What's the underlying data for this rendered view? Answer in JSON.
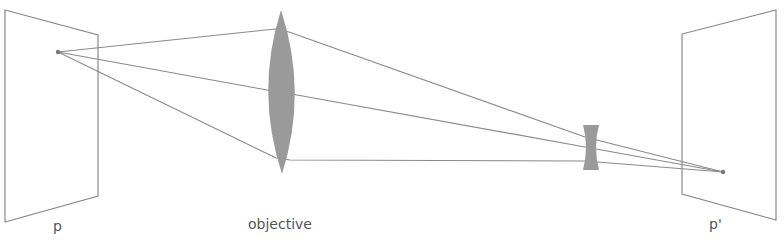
{
  "diagram": {
    "colors": {
      "plane": "#8a8a8a",
      "ray": "#8a8a8a",
      "lens": "#9a9a9a",
      "label": "#555555",
      "background": "#ffffff"
    },
    "labels": {
      "object_plane": "p",
      "objective": "objective",
      "image_plane": "p'"
    },
    "object_plane": {
      "points": "5,10 98,35 98,196 5,222"
    },
    "image_plane": {
      "points": "682,34 776,10 776,220 682,194"
    },
    "object_point": {
      "x": 58,
      "y": 52
    },
    "image_point": {
      "x": 723,
      "y": 172
    },
    "objective_lens": {
      "path": "M281,10 Q308,92 282,174 Q255,92 281,10 Z"
    },
    "diverging_lens": {
      "path": "M583,125 L599,125 Q593,147 599,170 L583,170 Q589,147 583,125 Z"
    },
    "rays": [
      {
        "name": "top",
        "points": "58,52 275,29 289,32 585,137 723,172"
      },
      {
        "name": "middle",
        "points": "58,52 267,90 297,95 585,147 723,172"
      },
      {
        "name": "bottom",
        "points": "58,52 276,158 290,160 585,161 723,172"
      }
    ]
  }
}
